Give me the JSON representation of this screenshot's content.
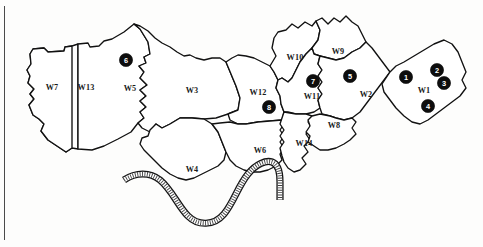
{
  "figure": {
    "kind": "ward-boundary-map",
    "background_color": "#fdfdfc",
    "ink_color": "#111111",
    "marker_color": "#0d0d0d",
    "marker_text_color": "#ffffff"
  },
  "frame": {
    "left_rule_present": true
  },
  "wards": [
    {
      "id": "W1",
      "label": "W1",
      "label_x": 424,
      "label_y": 91
    },
    {
      "id": "W2",
      "label": "W2",
      "label_y": 95,
      "label_x": 366
    },
    {
      "id": "W3",
      "label": "W3",
      "label_x": 192,
      "label_y": 91
    },
    {
      "id": "W4",
      "label": "W4",
      "label_x": 192,
      "label_y": 170
    },
    {
      "id": "W5",
      "label": "W5",
      "label_x": 130,
      "label_y": 89
    },
    {
      "id": "W6",
      "label": "W6",
      "label_x": 260,
      "label_y": 151
    },
    {
      "id": "W7",
      "label": "W7",
      "label_x": 52,
      "label_y": 88
    },
    {
      "id": "W8",
      "label": "W8",
      "label_x": 334,
      "label_y": 126
    },
    {
      "id": "W9",
      "label": "W9",
      "label_x": 338,
      "label_y": 52
    },
    {
      "id": "W10",
      "label": "W10",
      "label_x": 295,
      "label_y": 58
    },
    {
      "id": "W11",
      "label": "W11",
      "label_x": 312,
      "label_y": 97
    },
    {
      "id": "W12",
      "label": "W12",
      "label_x": 258,
      "label_y": 93
    },
    {
      "id": "W13",
      "label": "W13",
      "label_x": 86,
      "label_y": 88
    },
    {
      "id": "W14",
      "label": "W14",
      "label_x": 304,
      "label_y": 144
    }
  ],
  "markers": [
    {
      "number": "1",
      "x": 406,
      "y": 77,
      "ward": "W1"
    },
    {
      "number": "2",
      "x": 437,
      "y": 70,
      "ward": "W1"
    },
    {
      "number": "3",
      "x": 444,
      "y": 83,
      "ward": "W1"
    },
    {
      "number": "4",
      "x": 428,
      "y": 106,
      "ward": "W1"
    },
    {
      "number": "5",
      "x": 350,
      "y": 76,
      "ward": "W2"
    },
    {
      "number": "6",
      "x": 126,
      "y": 60,
      "ward": "W5"
    },
    {
      "number": "7",
      "x": 313,
      "y": 81,
      "ward": "W11"
    },
    {
      "number": "8",
      "x": 269,
      "y": 107,
      "ward": "W12"
    }
  ],
  "river": {
    "name": "river",
    "style": "stippled-band",
    "description": "thick S-curved stippled band crossing the lower portion of the map"
  }
}
